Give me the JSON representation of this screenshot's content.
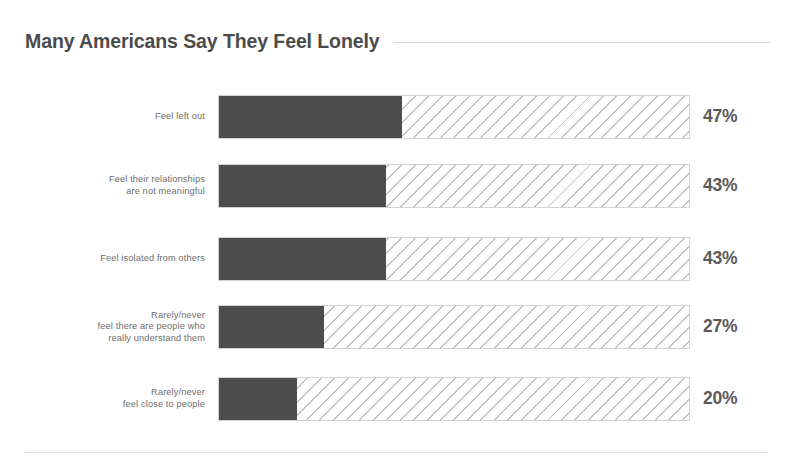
{
  "header": {
    "title": "Many Americans Say They Feel Lonely"
  },
  "chart_data": {
    "type": "bar",
    "title": "Many Americans Say They Feel Lonely",
    "xlabel": "",
    "ylabel": "",
    "orientation": "horizontal",
    "grid": false,
    "legend": false,
    "axis_max_percent": 121,
    "value_suffix": "%",
    "colors": {
      "bar_fill": "#4d4d4d",
      "bar_track_hatch": "#c2c2c2",
      "bar_track_border": "#d3d3d3",
      "title_text": "#4b4b4b",
      "label_text": "#6d6d6d",
      "value_text": "#5a5a5a",
      "rule": "#d8d8d8",
      "background": "#ffffff"
    },
    "categories": [
      "Feel left out",
      "Feel their relationships are not meaningful",
      "Feel isolated from others",
      "Rarely/never feel there are people who really understand them",
      "Rarely/never feel close to people"
    ],
    "values": [
      47,
      43,
      43,
      27,
      20
    ],
    "bars": [
      {
        "label_lines": [
          "Feel left out"
        ],
        "label": "Feel left out",
        "value": 47,
        "value_label": "47%"
      },
      {
        "label_lines": [
          "Feel their relationships",
          "are not meaningful"
        ],
        "label": "Feel their relationships are not meaningful",
        "value": 43,
        "value_label": "43%"
      },
      {
        "label_lines": [
          "Feel isolated from others"
        ],
        "label": "Feel isolated from others",
        "value": 43,
        "value_label": "43%"
      },
      {
        "label_lines": [
          "Rarely/never",
          "feel there are people who",
          "really understand them"
        ],
        "label": "Rarely/never feel there are people who really understand them",
        "value": 27,
        "value_label": "27%"
      },
      {
        "label_lines": [
          "Rarely/never",
          "feel close to people"
        ],
        "label": "Rarely/never feel close to people",
        "value": 20,
        "value_label": "20%"
      }
    ]
  },
  "layout": {
    "row_tops": [
      17,
      86,
      159,
      227,
      299
    ],
    "bar_track_left": 218,
    "bar_track_width": 472
  }
}
